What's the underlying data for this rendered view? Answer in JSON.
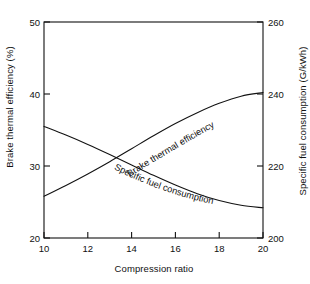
{
  "chart_data": {
    "type": "line",
    "title": "",
    "subtitle": "",
    "xlabel": "Compression ratio",
    "ylabel": "Brake thermal efficiency (%)",
    "y2label": "Specific fuel consumption (G/kWh)",
    "xlim": [
      10,
      20
    ],
    "ylim": [
      20,
      50
    ],
    "y2lim": [
      200,
      260
    ],
    "xticks": [
      "10",
      "12",
      "14",
      "16",
      "18",
      "20"
    ],
    "xtick_values": [
      10,
      12,
      14,
      16,
      18,
      20
    ],
    "yticks": [
      "20",
      "30",
      "40",
      "50"
    ],
    "ytick_values": [
      20,
      30,
      40,
      50
    ],
    "y2ticks": [
      "200",
      "220",
      "240",
      "260"
    ],
    "y2tick_values": [
      200,
      220,
      240,
      260
    ],
    "grid": false,
    "legend": "inline-annotations",
    "series": [
      {
        "name": "Brake thermal efficiency",
        "axis": "left",
        "units": "%",
        "x": [
          10,
          11,
          12,
          13,
          14,
          15,
          16,
          17,
          18,
          19,
          20
        ],
        "values": [
          25.8,
          27.3,
          28.9,
          30.6,
          32.4,
          34.2,
          35.9,
          37.4,
          38.7,
          39.7,
          40.2
        ]
      },
      {
        "name": "Specific fuel consumption",
        "axis": "right",
        "units": "G/kWh",
        "x": [
          10,
          11,
          12,
          13,
          14,
          15,
          16,
          17,
          18,
          19,
          20
        ],
        "values": [
          231.0,
          228.6,
          226.0,
          223.2,
          220.3,
          217.4,
          214.7,
          212.3,
          210.4,
          209.1,
          208.4
        ]
      }
    ],
    "annotations": [
      {
        "text": "Brake thermal efficiency",
        "series": "Brake thermal efficiency"
      },
      {
        "text": "Specific fuel consumption",
        "series": "Specific fuel consumption"
      }
    ],
    "colors": {
      "curve": "#121212",
      "axis": "#121212",
      "background": "#ffffff"
    }
  }
}
